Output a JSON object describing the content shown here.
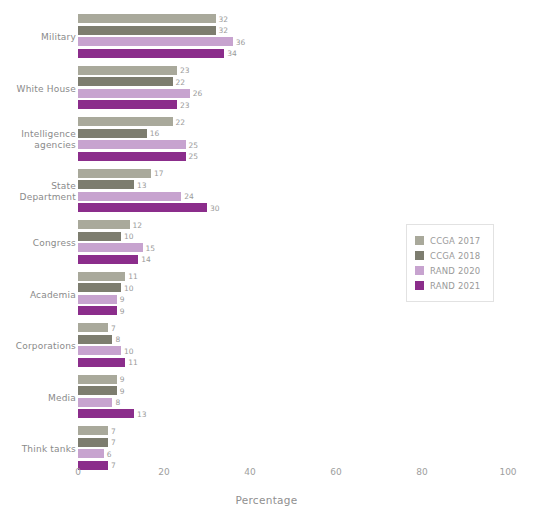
{
  "chart_data": {
    "type": "bar",
    "orientation": "horizontal",
    "title": "",
    "xlabel": "Percentage",
    "ylabel": "",
    "xlim": [
      0,
      100
    ],
    "xticks": [
      0,
      20,
      40,
      60,
      80,
      100
    ],
    "grid": false,
    "legend_position": "right",
    "categories": [
      "Military",
      "White House",
      "Intelligence agencies",
      "State Department",
      "Congress",
      "Academia",
      "Corporations",
      "Media",
      "Think tanks"
    ],
    "category_lines": [
      [
        "Military"
      ],
      [
        "White House"
      ],
      [
        "Intelligence",
        "agencies"
      ],
      [
        "State",
        "Department"
      ],
      [
        "Congress"
      ],
      [
        "Academia"
      ],
      [
        "Corporations"
      ],
      [
        "Media"
      ],
      [
        "Think tanks"
      ]
    ],
    "series": [
      {
        "name": "CCGA 2017",
        "color": "#a9a99b",
        "values": [
          32,
          23,
          22,
          17,
          12,
          11,
          7,
          9,
          7
        ]
      },
      {
        "name": "CCGA 2018",
        "color": "#7d7d6f",
        "values": [
          32,
          22,
          16,
          13,
          10,
          10,
          8,
          9,
          7
        ]
      },
      {
        "name": "RAND 2020",
        "color": "#c7a3cf",
        "values": [
          36,
          26,
          25,
          24,
          15,
          9,
          10,
          8,
          6
        ]
      },
      {
        "name": "RAND 2021",
        "color": "#8b2d8b",
        "values": [
          34,
          23,
          25,
          30,
          14,
          9,
          11,
          13,
          7
        ]
      }
    ]
  },
  "axis": {
    "x_tick_labels": [
      "0",
      "20",
      "40",
      "60",
      "80",
      "100"
    ],
    "x_axis_title": "Percentage"
  },
  "legend": {
    "entries": [
      {
        "label": "CCGA 2017",
        "color": "#a9a99b"
      },
      {
        "label": "CCGA 2018",
        "color": "#7d7d6f"
      },
      {
        "label": "RAND 2020",
        "color": "#c7a3cf"
      },
      {
        "label": "RAND 2021",
        "color": "#8b2d8b"
      }
    ]
  }
}
